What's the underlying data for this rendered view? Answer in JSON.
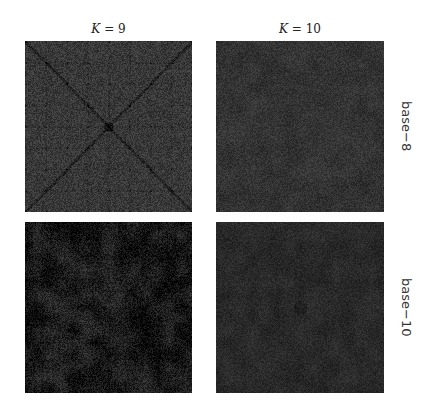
{
  "chart_data": {
    "type": "heatmap",
    "title": "",
    "layout": "2x2 grid",
    "columns": [
      {
        "label_var": "K",
        "label_op": "=",
        "label_value": "9"
      },
      {
        "label_var": "K",
        "label_op": "=",
        "label_value": "10"
      }
    ],
    "rows": [
      {
        "label": "base−8"
      },
      {
        "label": "base−10"
      }
    ],
    "colormap": "grayscale (dark)",
    "panels": [
      {
        "row": "base−8",
        "col": "K = 9",
        "pattern": "diagonal-cross with lattice of dark nodes",
        "mean_gray": 0.22,
        "variation": 0.08,
        "seed": 11
      },
      {
        "row": "base−8",
        "col": "K = 10",
        "pattern": "near-uniform noise",
        "mean_gray": 0.2,
        "variation": 0.06,
        "seed": 23
      },
      {
        "row": "base−10",
        "col": "K = 9",
        "pattern": "dark with blotchy lighter clusters",
        "mean_gray": 0.1,
        "variation": 0.09,
        "seed": 37
      },
      {
        "row": "base−10",
        "col": "K = 10",
        "pattern": "near-uniform noise with faint dark center",
        "mean_gray": 0.16,
        "variation": 0.05,
        "seed": 51
      }
    ],
    "axes": "none",
    "grid": false,
    "legend": "none"
  }
}
